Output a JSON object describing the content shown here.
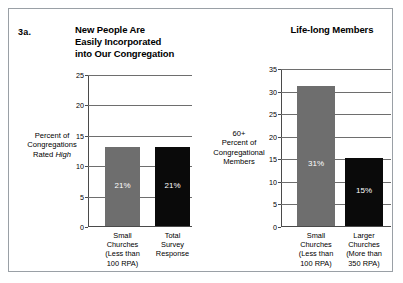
{
  "figure": {
    "number": "3a.",
    "frame_color": "#9aa0a6"
  },
  "colors": {
    "gray_bar": "#6e6e6e",
    "black_bar": "#0a0a0a",
    "axis": "#4a4a4a",
    "grid": "#6e6e6e",
    "value_label": "#ffffff"
  },
  "panels": {
    "left": {
      "title_line1": "New People Are",
      "title_line2": "Easily Incorporated",
      "title_line3": "into Our Congregation",
      "caption_line1": "Percent of",
      "caption_line2": "Congregations",
      "caption_line3_pre": "Rated ",
      "caption_line3_em": "High",
      "ticks": [
        "25",
        "20",
        "15",
        "10",
        "5",
        "0"
      ],
      "bars": [
        {
          "value_label": "21%",
          "cat_line1": "Small",
          "cat_line2": "Churches",
          "cat_line3": "(Less than",
          "cat_line4": "100 RPA)"
        },
        {
          "value_label": "21%",
          "cat_line1": "Total",
          "cat_line2": "Survey",
          "cat_line3": "Response",
          "cat_line4": ""
        }
      ]
    },
    "right": {
      "title": "Life-long Members",
      "caption_line1": "60+",
      "caption_line2": "Percent of",
      "caption_line3": "Congregational",
      "caption_line4": "Members",
      "ticks": [
        "35",
        "30",
        "25",
        "20",
        "15",
        "10",
        "5",
        "0"
      ],
      "bars": [
        {
          "value_label": "31%",
          "cat_line1": "Small",
          "cat_line2": "Churches",
          "cat_line3": "(Less than",
          "cat_line4": "100 RPA)"
        },
        {
          "value_label": "15%",
          "cat_line1": "Larger",
          "cat_line2": "Churches",
          "cat_line3": "(More than",
          "cat_line4": "350 RPA)"
        }
      ]
    }
  },
  "chart_data": [
    {
      "type": "bar",
      "title": "New People Are Easily Incorporated into Our Congregation",
      "xlabel": "",
      "ylabel": "Percent of Congregations Rated High",
      "categories": [
        "Small Churches (Less than 100 RPA)",
        "Total Survey Response"
      ],
      "values": [
        13,
        13
      ],
      "data_labels": [
        "21%",
        "21%"
      ],
      "series_colors": [
        "#6e6e6e",
        "#0a0a0a"
      ],
      "ylim": [
        0,
        25
      ],
      "ytick_step": 5,
      "yticks": [
        0,
        5,
        10,
        15,
        20,
        25
      ],
      "grid": true,
      "legend": "none"
    },
    {
      "type": "bar",
      "title": "Life-long Members",
      "xlabel": "",
      "ylabel": "60+ Percent of Congregational Members",
      "categories": [
        "Small Churches (Less than 100 RPA)",
        "Larger Churches (More than 350 RPA)"
      ],
      "values": [
        31,
        15
      ],
      "data_labels": [
        "31%",
        "15%"
      ],
      "series_colors": [
        "#6e6e6e",
        "#0a0a0a"
      ],
      "ylim": [
        0,
        35
      ],
      "ytick_step": 5,
      "yticks": [
        0,
        5,
        10,
        15,
        20,
        25,
        30,
        35
      ],
      "grid": true,
      "legend": "none"
    }
  ]
}
